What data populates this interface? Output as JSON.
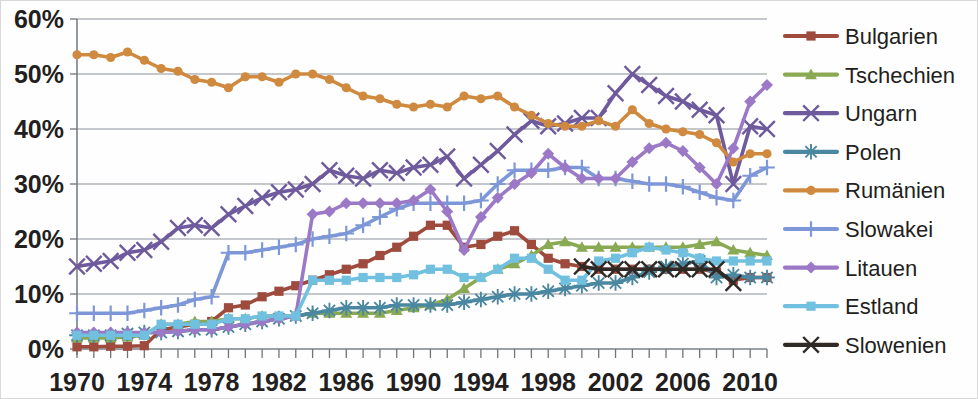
{
  "chart_data": {
    "type": "line",
    "title": "",
    "xlabel": "",
    "ylabel": "",
    "xlim": [
      1970,
      2011
    ],
    "ylim": [
      0,
      60
    ],
    "ytick_labels": [
      "0%",
      "10%",
      "20%",
      "30%",
      "40%",
      "50%",
      "60%"
    ],
    "ytick_values": [
      0,
      10,
      20,
      30,
      40,
      50,
      60
    ],
    "xtick_labels": [
      "1970",
      "1974",
      "1978",
      "1982",
      "1986",
      "1990",
      "1994",
      "1998",
      "2002",
      "2006",
      "2010"
    ],
    "xtick_values": [
      1970,
      1974,
      1978,
      1982,
      1986,
      1990,
      1994,
      1998,
      2002,
      2006,
      2010
    ],
    "minor_xticks_every": 1,
    "grid": "horizontal",
    "legend_position": "right",
    "x": [
      1970,
      1971,
      1972,
      1973,
      1974,
      1975,
      1976,
      1977,
      1978,
      1979,
      1980,
      1981,
      1982,
      1983,
      1984,
      1985,
      1986,
      1987,
      1988,
      1989,
      1990,
      1991,
      1992,
      1993,
      1994,
      1995,
      1996,
      1997,
      1998,
      1999,
      2000,
      2001,
      2002,
      2003,
      2004,
      2005,
      2006,
      2007,
      2008,
      2009,
      2010,
      2011
    ],
    "series": [
      {
        "name": "Bulgarien",
        "color": "#9e4a3c",
        "marker": "square",
        "values": [
          0.4,
          0.4,
          0.5,
          0.5,
          0.6,
          3.5,
          4.0,
          4.5,
          5.0,
          7.5,
          8.0,
          9.5,
          10.5,
          11.5,
          12.5,
          13.5,
          14.5,
          15.5,
          17.0,
          18.5,
          20.5,
          22.5,
          22.5,
          18.5,
          19.0,
          20.5,
          21.5,
          19.0,
          16.5,
          15.5,
          15.0,
          14.5,
          14.5,
          14.5,
          14.5,
          14.5,
          14.5,
          14.5,
          14.0,
          12.5,
          13.0,
          13.0
        ]
      },
      {
        "name": "Tschechien",
        "color": "#8aa953",
        "marker": "triangle",
        "values": [
          2.0,
          2.0,
          2.0,
          2.2,
          2.5,
          4.5,
          4.5,
          5.0,
          5.0,
          5.5,
          5.5,
          6.0,
          6.0,
          6.0,
          6.5,
          6.5,
          6.5,
          6.5,
          6.5,
          7.0,
          7.5,
          8.0,
          9.0,
          11.0,
          13.0,
          14.5,
          15.5,
          17.0,
          19.0,
          19.5,
          18.5,
          18.5,
          18.5,
          18.5,
          18.5,
          18.5,
          18.5,
          19.0,
          19.5,
          18.0,
          17.5,
          17.0
        ]
      },
      {
        "name": "Ungarn",
        "color": "#6e5a9c",
        "marker": "x",
        "values": [
          15.0,
          15.5,
          16.0,
          17.5,
          18.0,
          19.5,
          22.0,
          22.5,
          22.0,
          24.5,
          26.0,
          27.5,
          28.5,
          29.0,
          30.0,
          32.5,
          31.5,
          31.0,
          32.5,
          32.0,
          33.0,
          33.5,
          35.0,
          31.0,
          33.5,
          36.0,
          39.0,
          41.5,
          40.5,
          41.0,
          42.0,
          42.0,
          46.5,
          50.0,
          48.0,
          46.0,
          45.0,
          43.5,
          42.5,
          30.0,
          40.5,
          40.0
        ]
      },
      {
        "name": "Polen",
        "color": "#4a87a0",
        "marker": "asterisk",
        "values": [
          2.5,
          2.5,
          2.5,
          2.8,
          3.0,
          3.0,
          3.2,
          3.5,
          3.5,
          4.0,
          4.5,
          5.0,
          5.5,
          6.0,
          6.5,
          7.0,
          7.5,
          7.5,
          7.5,
          8.0,
          8.0,
          8.0,
          8.0,
          8.5,
          9.0,
          9.5,
          10.0,
          10.0,
          10.5,
          11.0,
          11.5,
          12.0,
          12.0,
          13.0,
          14.0,
          15.0,
          15.5,
          16.0,
          13.0,
          13.5,
          13.0,
          13.0
        ]
      },
      {
        "name": "Rumänien",
        "color": "#cf8a3f",
        "marker": "circle",
        "values": [
          53.5,
          53.5,
          53.0,
          54.0,
          52.5,
          51.0,
          50.5,
          49.0,
          48.5,
          47.5,
          49.5,
          49.5,
          48.5,
          50.0,
          50.0,
          49.0,
          47.5,
          46.0,
          45.5,
          44.5,
          44.0,
          44.5,
          44.0,
          46.0,
          45.5,
          46.0,
          44.0,
          42.5,
          41.0,
          40.5,
          40.5,
          41.5,
          40.5,
          43.5,
          41.0,
          40.0,
          39.5,
          39.0,
          37.5,
          34.0,
          35.5,
          35.5
        ]
      },
      {
        "name": "Slowakei",
        "color": "#7d97d8",
        "marker": "plus",
        "values": [
          6.5,
          6.5,
          6.5,
          6.5,
          7.0,
          7.5,
          8.0,
          9.0,
          9.5,
          17.5,
          17.5,
          18.0,
          18.5,
          19.0,
          20.0,
          20.5,
          21.0,
          22.5,
          24.0,
          25.5,
          26.5,
          26.5,
          26.5,
          26.5,
          27.0,
          30.0,
          32.5,
          32.5,
          32.5,
          33.0,
          33.0,
          31.0,
          31.0,
          30.5,
          30.0,
          30.0,
          29.5,
          28.5,
          27.5,
          27.0,
          31.5,
          33.0
        ]
      },
      {
        "name": "Litauen",
        "color": "#9b79c6",
        "marker": "diamond",
        "values": [
          3.0,
          3.0,
          3.0,
          3.0,
          3.0,
          3.0,
          3.2,
          3.5,
          3.5,
          4.0,
          4.5,
          5.0,
          5.5,
          6.0,
          24.5,
          25.0,
          26.5,
          26.5,
          26.5,
          26.5,
          27.0,
          29.0,
          25.0,
          18.0,
          24.0,
          27.5,
          30.0,
          32.0,
          35.5,
          33.0,
          31.0,
          31.0,
          31.0,
          34.0,
          36.5,
          37.5,
          36.0,
          33.0,
          30.0,
          36.5,
          45.0,
          48.0
        ]
      },
      {
        "name": "Estland",
        "color": "#72c0e0",
        "marker": "square",
        "values": [
          2.5,
          2.5,
          2.5,
          2.5,
          2.5,
          4.5,
          4.5,
          4.5,
          4.5,
          5.5,
          5.5,
          6.0,
          6.0,
          6.0,
          12.5,
          12.5,
          12.5,
          13.0,
          13.0,
          13.0,
          13.5,
          14.5,
          14.5,
          13.0,
          13.0,
          14.5,
          16.5,
          16.5,
          14.5,
          12.5,
          12.5,
          16.0,
          16.5,
          17.5,
          18.5,
          18.0,
          17.5,
          16.5,
          16.0,
          16.0,
          16.0,
          16.0
        ]
      },
      {
        "name": "Slowenien",
        "color": "#2f2a26",
        "marker": "x",
        "values": [
          null,
          null,
          null,
          null,
          null,
          null,
          null,
          null,
          null,
          null,
          null,
          null,
          null,
          null,
          null,
          null,
          null,
          null,
          null,
          null,
          null,
          null,
          null,
          null,
          null,
          null,
          null,
          null,
          null,
          null,
          15.0,
          14.5,
          14.5,
          14.5,
          14.5,
          14.5,
          14.5,
          14.5,
          14.5,
          12.0,
          null,
          null
        ]
      }
    ]
  },
  "legend": {
    "items": [
      {
        "label": "Bulgarien"
      },
      {
        "label": "Tschechien"
      },
      {
        "label": "Ungarn"
      },
      {
        "label": "Polen"
      },
      {
        "label": "Rumänien"
      },
      {
        "label": "Slowakei"
      },
      {
        "label": "Litauen"
      },
      {
        "label": "Estland"
      },
      {
        "label": "Slowenien"
      }
    ]
  }
}
